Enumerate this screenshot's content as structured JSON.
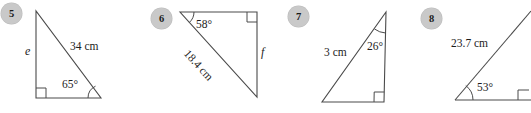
{
  "page": {
    "background_color": "#ffffff",
    "line_color": "#4a4a4a",
    "badge_color": "#c9c9c9",
    "text_color": "#1c1c1c"
  },
  "problems": [
    {
      "number": "5",
      "badge": {
        "x": 1,
        "y": 3
      },
      "shape": "right-triangle",
      "labels": {
        "side_label": "e",
        "hypotenuse_label": "34 cm",
        "angle_label": "65°"
      },
      "geometry": {
        "apex": [
          36,
          11
        ],
        "bottom_left": [
          36,
          98
        ],
        "bottom_right": [
          101,
          98
        ],
        "right_angle_at": "bottom_left",
        "marked_angle_at": "bottom_right"
      }
    },
    {
      "number": "6",
      "badge": {
        "x": 151,
        "y": 8
      },
      "shape": "right-triangle",
      "labels": {
        "side_label": "f",
        "hypotenuse_label": "18.4 cm",
        "angle_label": "58°"
      },
      "geometry": {
        "top_left": [
          180,
          12
        ],
        "top_right": [
          257,
          12
        ],
        "bottom_right": [
          257,
          97
        ],
        "right_angle_at": "top_right",
        "marked_angle_at": "top_left"
      }
    },
    {
      "number": "7",
      "badge": {
        "x": 288,
        "y": 6
      },
      "shape": "right-triangle",
      "labels": {
        "side_label": "3 cm",
        "angle_label": "26°"
      },
      "geometry": {
        "apex": [
          386,
          12
        ],
        "bottom_left": [
          322,
          102
        ],
        "bottom_right": [
          384,
          102
        ],
        "right_angle_at": "bottom_right",
        "marked_angle_at": "apex"
      }
    },
    {
      "number": "8",
      "badge": {
        "x": 421,
        "y": 8
      },
      "shape": "right-triangle",
      "labels": {
        "hypotenuse_label": "23.7 cm",
        "angle_label": "53°"
      },
      "geometry": {
        "bottom_left": [
          455,
          100
        ],
        "bottom_right": [
          531,
          100
        ],
        "apex": [
          531,
          11
        ],
        "right_angle_at": "bottom_right",
        "marked_angle_at": "bottom_left",
        "clipped": "right edge"
      }
    }
  ]
}
